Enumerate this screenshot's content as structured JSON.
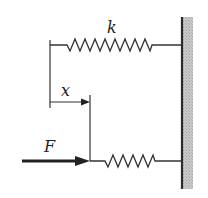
{
  "diagram": {
    "labels": {
      "spring_constant": "k",
      "displacement": "x",
      "force": "F"
    },
    "colors": {
      "line": "#333333",
      "wall_fill": "#bdbdbd",
      "wall_edge": "#2a2a2a"
    }
  }
}
